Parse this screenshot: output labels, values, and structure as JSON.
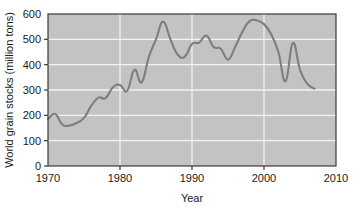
{
  "chart_data": {
    "type": "line",
    "title": "",
    "xlabel": "Year",
    "ylabel": "World grain stocks (million tons)",
    "xlim": [
      1970,
      2010
    ],
    "ylim": [
      0,
      600
    ],
    "grid": true,
    "legend_position": "none",
    "xticks": [
      1970,
      1980,
      1990,
      2000,
      2010
    ],
    "xtick_labels": [
      "1970",
      "1980",
      "1990",
      "2000",
      "2010"
    ],
    "yticks": [
      0,
      100,
      200,
      300,
      400,
      500,
      600
    ],
    "ytick_labels": [
      "0",
      "100",
      "200",
      "300",
      "400",
      "500",
      "600"
    ],
    "series": [
      {
        "name": "World grain stocks",
        "color": "#7d7d85",
        "x": [
          1970,
          1971,
          1972,
          1973,
          1974,
          1975,
          1976,
          1977,
          1978,
          1979,
          1980,
          1981,
          1982,
          1983,
          1984,
          1985,
          1986,
          1987,
          1988,
          1989,
          1990,
          1991,
          1992,
          1993,
          1994,
          1995,
          1996,
          1997,
          1998,
          1999,
          2000,
          2001,
          2002,
          2003,
          2004,
          2005,
          2006,
          2007
        ],
        "values": [
          185,
          205,
          163,
          160,
          170,
          190,
          237,
          270,
          268,
          310,
          320,
          297,
          380,
          330,
          430,
          500,
          570,
          500,
          440,
          432,
          482,
          487,
          515,
          470,
          463,
          420,
          470,
          530,
          572,
          575,
          560,
          520,
          450,
          335,
          485,
          380,
          325,
          305
        ]
      }
    ]
  },
  "colors": {
    "plot_background": "#c3c3c3",
    "gridline": "#f2f2f2",
    "axis": "#3a3a3a",
    "line": "#7d7d85",
    "text": "#1a1a1a",
    "page_background": "#ffffff"
  }
}
